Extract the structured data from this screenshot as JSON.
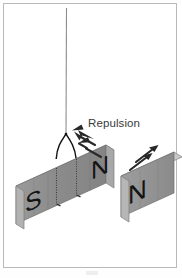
{
  "figure": {
    "background_color": "#ffffff",
    "border_color": "#b9b9b9",
    "annotation": "Repulsion",
    "annotation_color": "#3a3a3a"
  },
  "suspension": {
    "thread_label": "thread",
    "thread_color": "#8d8d8d",
    "fork_color": "#1a1a1a",
    "top_x": 66,
    "top_y": 8,
    "split_y": 134,
    "left_attach_x": 56,
    "right_attach_x": 76,
    "attach_y": 160
  },
  "magnets": [
    {
      "id": "suspended-magnet",
      "name": "suspended bar magnet",
      "left_pole": "S",
      "right_pole": "N",
      "face_color": "#8a8a8a",
      "top_color": "#cfcfcf",
      "end_color": "#b4b4b4",
      "edge_color": "#6f6f6f",
      "pole_text_color": "#161616",
      "suspended": true
    },
    {
      "id": "fixed-magnet",
      "name": "fixed bar magnet",
      "left_pole": "N",
      "right_pole": "",
      "face_color": "#8f8f8f",
      "top_color": "#d2d2d2",
      "end_color": "#b8b8b8",
      "edge_color": "#6f6f6f",
      "pole_text_color": "#161616",
      "suspended": false
    }
  ],
  "force_arrows": [
    {
      "id": "left-force-arrows",
      "direction": "up-left",
      "count": 2,
      "color": "#2a2a2a",
      "meaning": "force on suspended magnet pushing it away"
    },
    {
      "id": "right-force-arrows",
      "direction": "up-right",
      "count": 2,
      "color": "#2a2a2a",
      "meaning": "force on fixed magnet pushing it away"
    }
  ],
  "pole_labels": {
    "suspended_south": "S",
    "suspended_north": "N",
    "fixed_north": "N"
  }
}
